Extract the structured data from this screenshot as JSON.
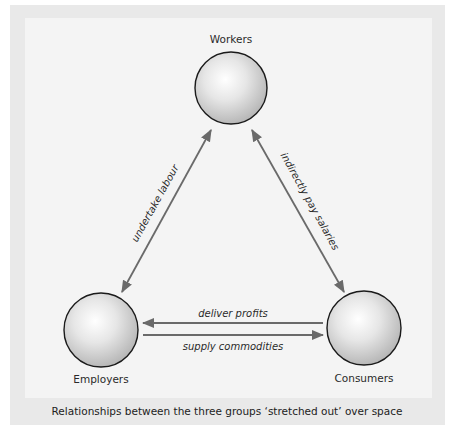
{
  "diagram": {
    "colors": {
      "outer_panel": "#e9e9e9",
      "inner_panel": "#f3f3f3",
      "circle_stroke": "#1a1a1a",
      "arrow": "#6a6a6a",
      "text": "#2a2a2a"
    },
    "nodes": [
      {
        "id": "workers",
        "label": "Workers"
      },
      {
        "id": "employers",
        "label": "Employers"
      },
      {
        "id": "consumers",
        "label": "Consumers"
      }
    ],
    "edges": [
      {
        "from": "employers",
        "to": "workers",
        "label": "undertake labour",
        "direction": "bidirectional"
      },
      {
        "from": "workers",
        "to": "consumers",
        "label": "indirectly pay salaries",
        "direction": "bidirectional"
      },
      {
        "from": "consumers",
        "to": "employers",
        "label": "deliver profits",
        "direction": "one-way"
      },
      {
        "from": "employers",
        "to": "consumers",
        "label": "supply commodities",
        "direction": "one-way"
      }
    ],
    "caption": "Relationships between the three groups ‘stretched out’ over space"
  }
}
